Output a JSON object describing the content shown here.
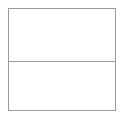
{
  "page": {
    "background_color": "#ffffff",
    "width": 126,
    "height": 119
  },
  "table": {
    "name": "empty-two-row-table",
    "border_color": "#9a9a9a",
    "border_width_px": 1,
    "fill_color": "#ffffff",
    "row_count": 2,
    "column_count": 1,
    "divider_color": "#9a9a9a",
    "rows": [
      {
        "label": "",
        "cells": [
          ""
        ]
      },
      {
        "label": "",
        "cells": [
          ""
        ]
      }
    ]
  }
}
